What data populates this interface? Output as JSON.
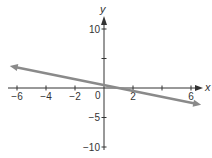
{
  "chart_data": {
    "type": "line",
    "title": "",
    "xlabel": "x",
    "ylabel": "y",
    "xlim": [
      -6.5,
      6.7
    ],
    "ylim": [
      -10,
      10
    ],
    "x_ticks": [
      -6,
      -4,
      -2,
      0,
      2,
      4,
      6
    ],
    "x_tick_labels": [
      "-6",
      "-4",
      "-2",
      "0",
      "2",
      "",
      "6"
    ],
    "y_ticks": [
      -10,
      -5,
      5,
      10
    ],
    "y_tick_labels": [
      "-10",
      "-5",
      "",
      "10"
    ],
    "grid": false,
    "series": [
      {
        "name": "line",
        "equation": "y = -0.5x + 0.5",
        "x": [
          -6.5,
          6.7
        ],
        "y": [
          3.75,
          -2.85
        ],
        "color": "#8a8a8a",
        "arrows": "both"
      }
    ]
  },
  "axis_color": "#333333"
}
